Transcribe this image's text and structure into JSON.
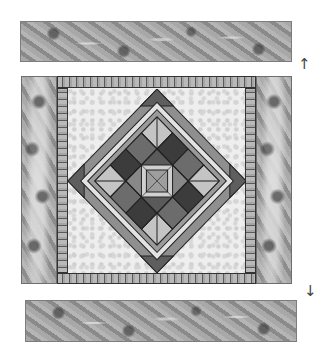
{
  "figure": {
    "parts": {
      "top_border": {
        "label": "top floral border strip"
      },
      "bottom_border": {
        "label": "bottom floral border strip"
      },
      "left_border": {
        "label": "left floral side border"
      },
      "right_border": {
        "label": "right floral side border"
      },
      "sashing": {
        "label": "striped sashing frame"
      },
      "center_block": {
        "label": "on-point pieced star block"
      }
    },
    "arrows": {
      "up": "↑",
      "down": "↓"
    },
    "colors": {
      "dark": "#3a3a3a",
      "medium": "#7a7a7a",
      "light": "#c8c8c8",
      "background_field": "#eeeeee",
      "outline": "#222222"
    }
  }
}
